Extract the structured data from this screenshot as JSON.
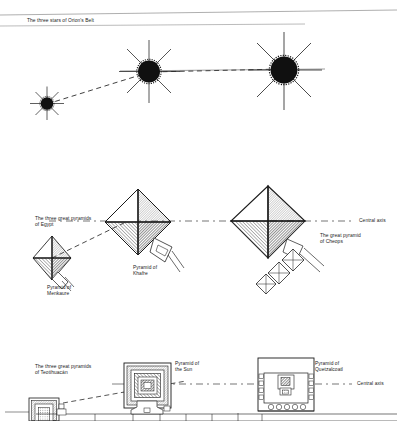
{
  "figure": {
    "title_caption": "",
    "panels": [
      {
        "id": "orion-belt",
        "label": "The three stars of Orion's Belt",
        "objects": [
          {
            "name": "star-left",
            "size": "small"
          },
          {
            "name": "star-middle",
            "size": "medium"
          },
          {
            "name": "star-right",
            "size": "large"
          }
        ]
      },
      {
        "id": "giza-pyramids",
        "label": "The three great pyramids\nof Egypt",
        "axis_label": "Central axis",
        "objects": [
          {
            "name": "pyramid-menkaure",
            "label": "Pyramid of\nMenkaure",
            "size": "small"
          },
          {
            "name": "pyramid-khafre",
            "label": "Pyramid of\nKhafre",
            "size": "medium"
          },
          {
            "name": "pyramid-cheops",
            "label": "The great pyramid\nof Cheops",
            "size": "large"
          }
        ]
      },
      {
        "id": "teotihuacan-pyramids",
        "label": "The three great pyramids\nof Teotihuacán",
        "axis_label": "Central axis",
        "objects": [
          {
            "name": "pyramid-of-the-sun",
            "label": "Pyramid of\nthe Sun"
          },
          {
            "name": "pyramid-of-quetzalcoatl",
            "label": "Pyramid of\nQuetzalcoatl"
          }
        ]
      }
    ]
  },
  "labels": {
    "orion_title": "The three stars of Orion's Belt",
    "egypt_title_line1": "The three great pyramids",
    "egypt_title_line2": "of Egypt",
    "menkaure_line1": "Pyramid of",
    "menkaure_line2": "Menkaure",
    "khafre_line1": "Pyramid of",
    "khafre_line2": "Khafre",
    "cheops_line1": "The great pyramid",
    "cheops_line2": "of Cheops",
    "central_axis_egypt": "Central axis",
    "teo_title_line1": "The three great pyramids",
    "teo_title_line2": "of Teotihuacán",
    "sun_line1": "Pyramid of",
    "sun_line2": "the Sun",
    "quetzalcoatl_line1": "Pyramid of",
    "quetzalcoatl_line2": "Quetzalcoatl",
    "central_axis_teo": "Central axis"
  },
  "colors": {
    "ink": "#1a1a1a",
    "paper": "#ffffff",
    "hatch": "#555555",
    "light_rule": "#9a9a9a"
  }
}
